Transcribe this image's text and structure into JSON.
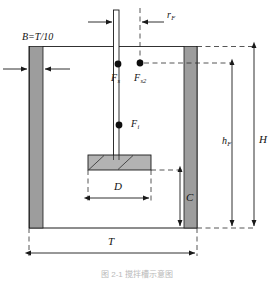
{
  "figure": {
    "type": "stirred-tank-cross-section",
    "title_caption": "图 2-1  搅拌槽示意图",
    "baffle_note": "B=T/10"
  },
  "labels": {
    "baffle_width": {
      "main": "B=T/10",
      "name": "baffle-width-note"
    },
    "radial_position": {
      "main": "r",
      "sub": "F"
    },
    "force_shaft": {
      "main": "F",
      "sub": "s"
    },
    "force_second": {
      "main": "F",
      "sub": "s2"
    },
    "force_impeller": {
      "main": "F",
      "sub": "i"
    },
    "impeller_diameter": {
      "main": "D",
      "sub": ""
    },
    "clearance": {
      "main": "C",
      "sub": ""
    },
    "liquid_height": {
      "main": "h",
      "sub": "F"
    },
    "tank_height": {
      "main": "H",
      "sub": ""
    },
    "tank_diameter": {
      "main": "T",
      "sub": ""
    }
  },
  "colors": {
    "line": "#1a1a1a",
    "baffle_fill": "#9d9d9d",
    "impeller_fill": "#b3b3b3",
    "dash": "#2b2b2b",
    "caption": "#b9b9b9",
    "background": "#ffffff"
  },
  "geometry": {
    "tank_left_x": 29,
    "tank_right_x": 197,
    "tank_top_y": 46,
    "tank_bottom_y": 228,
    "baffle_width_px": 14,
    "shaft_x": 116,
    "shaft_top_y": 10,
    "impeller_left_x": 88,
    "impeller_right_x": 151,
    "impeller_top_y": 155,
    "impeller_bottom_y": 170
  },
  "dimension_arrows": [
    {
      "name": "rF-horizontal",
      "from": "shaft-center",
      "to": "dash-vertical"
    },
    {
      "name": "B-left-outer",
      "orientation": "horizontal"
    },
    {
      "name": "B-left-inner",
      "orientation": "horizontal"
    },
    {
      "name": "D-width",
      "orientation": "horizontal"
    },
    {
      "name": "C-clearance",
      "orientation": "vertical"
    },
    {
      "name": "hF-liquid-height",
      "orientation": "vertical"
    },
    {
      "name": "H-tank-height",
      "orientation": "vertical"
    },
    {
      "name": "T-tank-diameter",
      "orientation": "horizontal"
    }
  ],
  "markers": [
    {
      "name": "point-Fs",
      "x": 118,
      "y": 64
    },
    {
      "name": "point-Fs2",
      "x": 140,
      "y": 63
    },
    {
      "name": "point-Fi",
      "x": 119,
      "y": 125
    }
  ]
}
